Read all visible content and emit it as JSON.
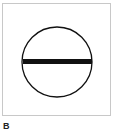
{
  "figure": {
    "label": "B",
    "symbol": {
      "name": "circle-with-horizontal-bar",
      "stroke_color": "#111111",
      "bar_color": "#111111"
    }
  }
}
